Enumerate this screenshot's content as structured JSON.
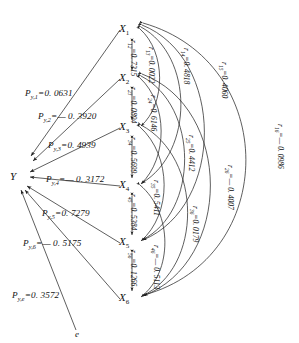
{
  "diagram": {
    "type": "path-analysis-diagram",
    "endogenous_node": "Y",
    "residual_node": "e",
    "nodes": [
      {
        "id": "x1",
        "label": "X",
        "sub": "1"
      },
      {
        "id": "x2",
        "label": "X",
        "sub": "2"
      },
      {
        "id": "x3",
        "label": "X",
        "sub": "3"
      },
      {
        "id": "x4",
        "label": "X",
        "sub": "4"
      },
      {
        "id": "x5",
        "label": "X",
        "sub": "5"
      },
      {
        "id": "x6",
        "label": "X",
        "sub": "6"
      }
    ],
    "path_coefficients": [
      {
        "id": "py1",
        "sym": "P",
        "sub": "y,1",
        "eq": "=",
        "value": "0. 0631",
        "text": "P y,1 = 0. 0631"
      },
      {
        "id": "py2",
        "sym": "P",
        "sub": "y,2",
        "eq": "=",
        "value": "— 0. 3920",
        "text": "P y,2 = — 0. 3920"
      },
      {
        "id": "py3",
        "sym": "P",
        "sub": "y,3",
        "eq": "=",
        "value": "0. 4939",
        "text": "P y,3 = 0. 4939"
      },
      {
        "id": "py4",
        "sym": "P",
        "sub": "y,4",
        "eq": "=",
        "value": "— 0. 3172",
        "text": "P y,4 = — 0. 3172"
      },
      {
        "id": "py5",
        "sym": "P",
        "sub": "y,5",
        "eq": "=",
        "value": "0. 7279",
        "text": "P y,5 = 0. 7279"
      },
      {
        "id": "py6",
        "sym": "P",
        "sub": "y,6",
        "eq": "=",
        "value": "— 0. 5175",
        "text": "P y,6 = — 0. 5175"
      },
      {
        "id": "pye",
        "sym": "P",
        "sub": "y,e",
        "eq": "=",
        "value": "0. 3572",
        "text": "P y,e = 0. 3572"
      }
    ],
    "correlations": [
      {
        "id": "r12",
        "sym": "r",
        "sub": "12",
        "value": "0. 7315",
        "text": "r12 = 0. 7315"
      },
      {
        "id": "r23",
        "sym": "r",
        "sub": "23",
        "value": "0. 0894",
        "text": "r23 = 0. 0894"
      },
      {
        "id": "r34",
        "sym": "r",
        "sub": "34",
        "value": "0. 5699",
        "text": "r34 = 0. 5699"
      },
      {
        "id": "r45",
        "sym": "r",
        "sub": "45",
        "value": "0. 5384",
        "text": "r45 = 0. 5384"
      },
      {
        "id": "r56",
        "sym": "r",
        "sub": "56",
        "value": "0. 1266",
        "text": "r56 = 0. 1266"
      },
      {
        "id": "r13",
        "sym": "r",
        "sub": "13",
        "value": "0. 0022",
        "text": "r13 = 0. 0022"
      },
      {
        "id": "r24",
        "sym": "r",
        "sub": "24",
        "value": "0. 6146",
        "text": "r24 = 0. 6146"
      },
      {
        "id": "r35",
        "sym": "r",
        "sub": "35",
        "value": "0. 5411",
        "text": "r35 = 0. 5411"
      },
      {
        "id": "r46",
        "sym": "r",
        "sub": "46",
        "value": "— 0. 5113",
        "text": "r46 = — 0. 5113"
      },
      {
        "id": "r14",
        "sym": "r",
        "sub": "14",
        "value": "0. 4818",
        "text": "r14 = 0. 4818"
      },
      {
        "id": "r25",
        "sym": "r",
        "sub": "25",
        "value": "0. 4412",
        "text": "r25 = 0. 4412"
      },
      {
        "id": "r36",
        "sym": "r",
        "sub": "36",
        "value": "0. 0179",
        "text": "r36 = 0. 0179"
      },
      {
        "id": "r15",
        "sym": "r",
        "sub": "15",
        "value": "0. 4060",
        "text": "r15 = 0. 4060"
      },
      {
        "id": "r26",
        "sym": "r",
        "sub": "26",
        "value": "— 0. 4007",
        "text": "r26 = — 0. 4007"
      },
      {
        "id": "r16",
        "sym": "r",
        "sub": "16",
        "value": "— 0. 0986",
        "text": "r16 = — 0. 0986"
      }
    ]
  },
  "labels": {
    "y": "Y",
    "e": "e",
    "eq": "=",
    "minus": "—"
  }
}
